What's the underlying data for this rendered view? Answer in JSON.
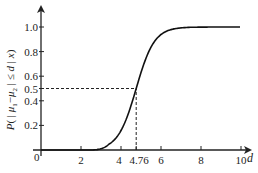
{
  "chart_data": {
    "type": "line",
    "title": "",
    "xlabel": "d",
    "ylabel": "P( | μ1−μ2 | ≤ d | x)",
    "xlim": [
      0,
      10.5
    ],
    "ylim": [
      0,
      1.1
    ],
    "grid": false,
    "legend": null,
    "x_ticks": [
      "0",
      "2",
      "4",
      "4.76",
      "6",
      "8",
      "10"
    ],
    "x_tick_values": [
      0,
      2,
      4,
      4.76,
      6,
      8,
      10
    ],
    "y_ticks": [
      "0.2",
      "0.4",
      "0.5",
      "0.6",
      "0.8",
      "1.0"
    ],
    "y_tick_values": [
      0.2,
      0.4,
      0.5,
      0.6,
      0.8,
      1.0
    ],
    "series": [
      {
        "name": "cumulative probability",
        "x": [
          0,
          1,
          2,
          2.5,
          3,
          3.5,
          4,
          4.5,
          4.76,
          5,
          5.5,
          6,
          6.5,
          7,
          8,
          9,
          10
        ],
        "y": [
          0,
          0,
          0,
          0.0,
          0.02,
          0.08,
          0.22,
          0.4,
          0.5,
          0.62,
          0.84,
          0.96,
          0.99,
          1.0,
          1.0,
          1.0,
          1.0
        ]
      }
    ],
    "annotations": [
      {
        "type": "dashed-line",
        "from": [
          0,
          0.5
        ],
        "to": [
          4.76,
          0.5
        ],
        "label": "P = 0.5"
      },
      {
        "type": "dashed-line",
        "from": [
          4.76,
          0
        ],
        "to": [
          4.76,
          0.5
        ],
        "label": "d = 4.76"
      }
    ]
  },
  "axes": {
    "origin_label": "0",
    "x_var": "d",
    "y_label_main": "P( | μ",
    "y_label_sub1": "1",
    "y_label_mid": "−μ",
    "y_label_sub2": "2",
    "y_label_end": " | ≤ d | x)"
  }
}
